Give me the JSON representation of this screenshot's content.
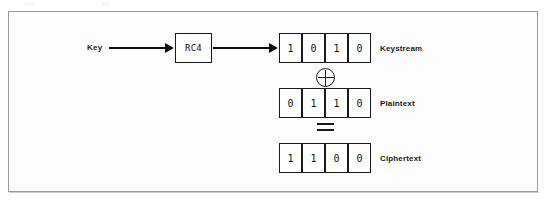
{
  "diagram": {
    "colors": {
      "frame_border": "#9a9a9a",
      "stroke": "#1a1a1a",
      "background": "#fdfdfd",
      "text": "#111111"
    },
    "key": {
      "label": "Key"
    },
    "cipher_box": {
      "label": "RC4"
    },
    "operators": {
      "xor": "⊕",
      "equals": "="
    },
    "rows": [
      {
        "id": "keystream",
        "label": "Keystream",
        "bits": [
          "1",
          "0",
          "1",
          "0"
        ]
      },
      {
        "id": "plaintext",
        "label": "Plaintext",
        "bits": [
          "0",
          "1",
          "1",
          "0"
        ]
      },
      {
        "id": "ciphertext",
        "label": "Ciphertext",
        "bits": [
          "1",
          "1",
          "0",
          "0"
        ]
      }
    ]
  }
}
